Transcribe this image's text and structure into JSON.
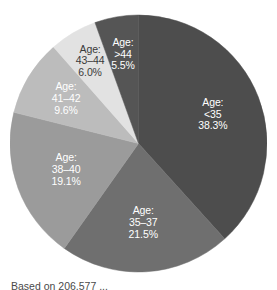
{
  "chart_data": {
    "type": "pie",
    "title": "",
    "subtitle": "",
    "xlabel": "",
    "ylabel": "",
    "legend_position": "none",
    "grid": false,
    "labels_inside_slices": true,
    "start_angle_deg": 0,
    "direction": "clockwise",
    "categories": [
      "Age: <35",
      "Age: 35–37",
      "Age: 38–40",
      "Age: 41–42",
      "Age: 43–44",
      "Age: >44"
    ],
    "values": [
      38.3,
      21.5,
      19.1,
      9.6,
      6.0,
      5.5
    ],
    "value_unit": "%",
    "slices": [
      {
        "category": "Age: <35",
        "label_line1": "Age:",
        "label_line2": "<35",
        "label_line3": "38.3%",
        "value": 38.3,
        "color": "#4d4d4d",
        "label_color": "light"
      },
      {
        "category": "Age: 35–37",
        "label_line1": "Age:",
        "label_line2": "35–37",
        "label_line3": "21.5%",
        "value": 21.5,
        "color": "#6f6f6f",
        "label_color": "light"
      },
      {
        "category": "Age: 38–40",
        "label_line1": "Age:",
        "label_line2": "38–40",
        "label_line3": "19.1%",
        "value": 19.1,
        "color": "#9b9b9b",
        "label_color": "light"
      },
      {
        "category": "Age: 41–42",
        "label_line1": "Age:",
        "label_line2": "41–42",
        "label_line3": "9.6%",
        "value": 9.6,
        "color": "#bcbcbc",
        "label_color": "light"
      },
      {
        "category": "Age: 43–44",
        "label_line1": "Age:",
        "label_line2": "43–44",
        "label_line3": "6.0%",
        "value": 6.0,
        "color": "#e2e2e2",
        "label_color": "dark"
      },
      {
        "category": "Age: >44",
        "label_line1": "Age:",
        "label_line2": ">44",
        "label_line3": "5.5%",
        "value": 5.5,
        "color": "#555555",
        "label_color": "light"
      }
    ]
  },
  "caption": {
    "text": "Based on 206,577 ..."
  }
}
